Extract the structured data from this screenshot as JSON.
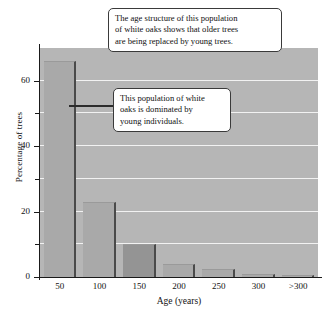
{
  "chart_data": {
    "type": "bar",
    "title": "",
    "subtitle": "",
    "xlabel": "Age (years)",
    "ylabel": "Percentage of trees",
    "categories": [
      "50",
      "100",
      "150",
      "200",
      "250",
      "300",
      ">300"
    ],
    "values": [
      66,
      23,
      10,
      4,
      2.5,
      1,
      0.5
    ],
    "series": [
      {
        "name": "Percentage of trees",
        "values": [
          66,
          23,
          10,
          4,
          2.5,
          1,
          0.5
        ]
      }
    ],
    "ylim": [
      0,
      70
    ],
    "xlim_labels": [
      "50",
      ">300"
    ],
    "y_major_ticks": [
      0,
      20,
      40,
      60
    ],
    "y_major_tick_labels": [
      "0",
      "20",
      "40",
      "60"
    ],
    "y_minor_ticks": [
      10,
      30,
      50
    ],
    "gridlines": {
      "horizontal": true,
      "vertical": false,
      "values": [
        10,
        20,
        30,
        40,
        50,
        60,
        70
      ],
      "color": "#f2f2f2"
    },
    "legend": {
      "present": false,
      "position": "none",
      "entries": []
    },
    "annotations": [
      {
        "id": "callout-top",
        "text_lines": [
          "The age structure of this population",
          "of white oaks shows that older trees",
          "are being replaced by young trees."
        ],
        "has_leader_line": false
      },
      {
        "id": "callout-bottom",
        "text_lines": [
          "This population of white",
          "oaks is dominated by",
          "young individuals."
        ],
        "has_leader_line": true,
        "points_to_category": "50"
      }
    ],
    "colors": {
      "plot_background": "#b6b6b6",
      "bar_fill": "#a9a9a9",
      "bar_fill_dark": "#949494",
      "bar_edge_shadow": "#4a4a4a",
      "gridline": "#f2f2f2",
      "axis": "#1a1a1a",
      "text": "#111111",
      "callout_background": "#ffffff",
      "callout_border": "#3a3a3a",
      "page_background": "#ffffff"
    }
  }
}
